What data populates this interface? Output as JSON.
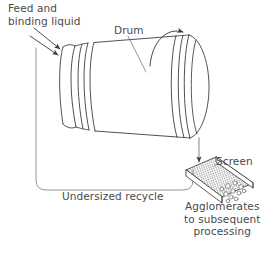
{
  "figure": {
    "background_color": "#ffffff",
    "line_color": "#3c3c3c",
    "text_color": "#4a4a4a"
  },
  "labels": {
    "feed": "Feed and\nbinding liquid",
    "drum": "Drum",
    "screen": "Screen",
    "undersized": "Undersized recycle",
    "agglomerates": "Agglomerates\nto subsequent\nprocessing"
  },
  "elements": {
    "drum_name": "rotating-drum",
    "screen_name": "vibrating-screen",
    "rotation_arrow": "clockwise-rotation-arrow",
    "feed_arrow": "feed-inlet-arrow",
    "discharge_arrow": "drum-discharge-arrow",
    "recycle_path": "undersized-recycle-loop",
    "product_particles": "agglomerate-particles"
  }
}
